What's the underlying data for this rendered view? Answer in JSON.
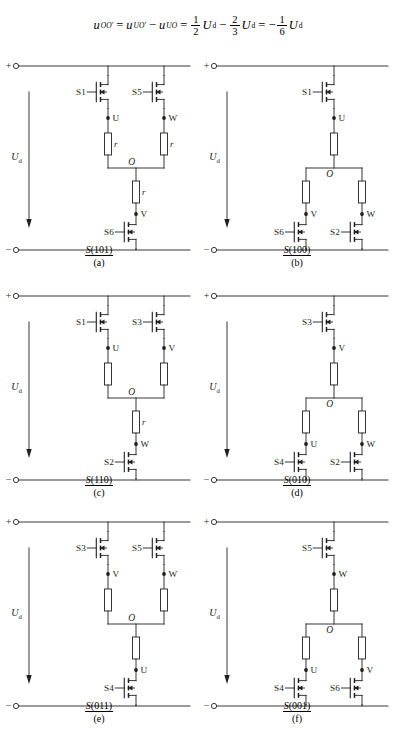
{
  "equation": {
    "lhs": "u",
    "lhs_sub": "OO′",
    "eq1": "=",
    "t1": "u",
    "t1_sub": "UO′",
    "minus1": "−",
    "t2": "u",
    "t2_sub": "UO",
    "eq2": "=",
    "f1_num": "1",
    "f1_den": "2",
    "u1": "U",
    "u1_sub": "d",
    "minus2": "−",
    "f2_num": "2",
    "f2_den": "3",
    "u2": "U",
    "u2_sub": "d",
    "eq3": "=",
    "minus3": "−",
    "f3_num": "1",
    "f3_den": "6",
    "u3": "U",
    "u3_sub": "d",
    "full_text": "u_OO' = u_UO' - u_UO = (1/2)U_d - (2/3)U_d = -(1/6)U_d"
  },
  "common": {
    "plus_terminal": "+",
    "minus_terminal": "−",
    "source_label": "U",
    "source_label_sub": "d",
    "node_o": "O",
    "resistor_label": "r"
  },
  "circuits": [
    {
      "id": "a",
      "caption_top": "S(101)",
      "caption_bottom": "(a)",
      "state": "101",
      "topology": "two-high-one-low",
      "top_switches": [
        {
          "name": "S1",
          "node": "U"
        },
        {
          "name": "S5",
          "node": "W"
        }
      ],
      "bottom_switches": [
        {
          "name": "S6",
          "node": "V"
        }
      ],
      "resistor_labels": [
        "r",
        "r",
        "r"
      ]
    },
    {
      "id": "b",
      "caption_top": "S(100)",
      "caption_bottom": "(b)",
      "state": "100",
      "topology": "one-high-two-low",
      "top_switches": [
        {
          "name": "S1",
          "node": "U"
        }
      ],
      "bottom_switches": [
        {
          "name": "S6",
          "node": "V"
        },
        {
          "name": "S2",
          "node": "W"
        }
      ],
      "resistor_labels": [
        "",
        "",
        ""
      ]
    },
    {
      "id": "c",
      "caption_top": "S(110)",
      "caption_bottom": "(c)",
      "state": "110",
      "topology": "two-high-one-low",
      "top_switches": [
        {
          "name": "S1",
          "node": "U"
        },
        {
          "name": "S3",
          "node": "V"
        }
      ],
      "bottom_switches": [
        {
          "name": "S2",
          "node": "W"
        }
      ],
      "resistor_labels": [
        "",
        "",
        "r"
      ]
    },
    {
      "id": "d",
      "caption_top": "S(010)",
      "caption_bottom": "(d)",
      "state": "010",
      "topology": "one-high-two-low",
      "top_switches": [
        {
          "name": "S3",
          "node": "V"
        }
      ],
      "bottom_switches": [
        {
          "name": "S4",
          "node": "U"
        },
        {
          "name": "S2",
          "node": "W"
        }
      ],
      "resistor_labels": [
        "",
        "",
        ""
      ]
    },
    {
      "id": "e",
      "caption_top": "S(011)",
      "caption_bottom": "(e)",
      "state": "011",
      "topology": "two-high-one-low",
      "top_switches": [
        {
          "name": "S3",
          "node": "V"
        },
        {
          "name": "S5",
          "node": "W"
        }
      ],
      "bottom_switches": [
        {
          "name": "S4",
          "node": "U"
        }
      ],
      "resistor_labels": [
        "",
        "",
        ""
      ]
    },
    {
      "id": "f",
      "caption_top": "S(001)",
      "caption_bottom": "(f)",
      "state": "001",
      "topology": "one-high-two-low",
      "top_switches": [
        {
          "name": "S5",
          "node": "W"
        }
      ],
      "bottom_switches": [
        {
          "name": "S4",
          "node": "U"
        },
        {
          "name": "S6",
          "node": "V"
        }
      ],
      "resistor_labels": [
        "",
        "",
        ""
      ]
    }
  ]
}
